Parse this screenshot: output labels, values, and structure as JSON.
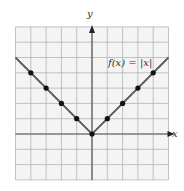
{
  "figure": {
    "function_label": "f(x) = |x|",
    "x_axis_label": "x",
    "y_axis_label": "y"
  },
  "chart_data": {
    "type": "line",
    "title": "f(x) = |x|",
    "xlabel": "x",
    "ylabel": "y",
    "xlim": [
      -5,
      5
    ],
    "ylim": [
      -3,
      7
    ],
    "grid": true,
    "grid_step": 1,
    "tick_labels_shown": false,
    "series": [
      {
        "name": "f(x) = |x|",
        "line_x": [
          -5,
          0,
          5
        ],
        "line_y": [
          5,
          0,
          5
        ],
        "points": [
          {
            "x": -4,
            "y": 4
          },
          {
            "x": -3,
            "y": 3
          },
          {
            "x": -2,
            "y": 2
          },
          {
            "x": -1,
            "y": 1
          },
          {
            "x": 0,
            "y": 0
          },
          {
            "x": 1,
            "y": 1
          },
          {
            "x": 2,
            "y": 2
          },
          {
            "x": 3,
            "y": 3
          },
          {
            "x": 4,
            "y": 4
          }
        ]
      }
    ]
  },
  "colors": {
    "grid_background": "#f4f4f4",
    "grid_line": "#b4b4b4",
    "axis": "#555555",
    "curve": "#5a5a5a",
    "point": "#111111"
  }
}
